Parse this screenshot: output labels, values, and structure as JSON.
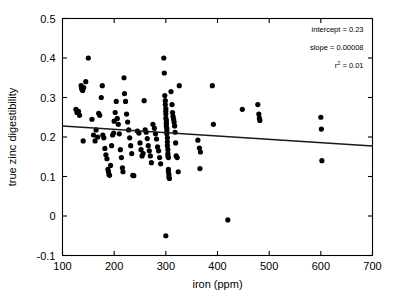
{
  "chart_data": {
    "type": "scatter",
    "title": "",
    "xlabel": "iron (ppm)",
    "ylabel": "true zinc digestibility",
    "xlim": [
      100,
      700
    ],
    "ylim": [
      -0.1,
      0.5
    ],
    "xticks": [
      100,
      200,
      300,
      400,
      500,
      600,
      700
    ],
    "xtick_labels": [
      "100",
      "200",
      "300",
      "400",
      "500",
      "600",
      "700"
    ],
    "yticks": [
      -0.1,
      0,
      0.1,
      0.2,
      0.3,
      0.4,
      0.5
    ],
    "ytick_labels": [
      "-0.1",
      "0",
      "0.1",
      "0.2",
      "0.3",
      "0.4",
      "0.5"
    ],
    "grid": false,
    "legend": false,
    "marker": "filled-circle",
    "marker_color": "#000000",
    "annotations": [
      "intercept = 0.23",
      "slope = 0.00008",
      "r² = 0.01"
    ],
    "annotation_intercept_label": "intercept = 0.23",
    "annotation_slope_label": "slope = 0.00008",
    "annotation_r2_prefix": "r",
    "annotation_r2_sup": "2",
    "annotation_r2_value": " = 0.01",
    "fit_line": {
      "intercept": 0.23,
      "slope": -8.5e-05,
      "x_start": 100,
      "y_start": 0.228,
      "x_end": 700,
      "y_end": 0.177,
      "color": "#1a1a1a"
    },
    "points": [
      [
        126,
        0.27
      ],
      [
        128,
        0.262
      ],
      [
        131,
        0.265
      ],
      [
        133,
        0.255
      ],
      [
        136,
        0.33
      ],
      [
        137,
        0.322
      ],
      [
        139,
        0.318
      ],
      [
        141,
        0.325
      ],
      [
        145,
        0.34
      ],
      [
        150,
        0.4
      ],
      [
        140,
        0.19
      ],
      [
        157,
        0.245
      ],
      [
        160,
        0.205
      ],
      [
        163,
        0.19
      ],
      [
        165,
        0.218
      ],
      [
        168,
        0.2
      ],
      [
        170,
        0.26
      ],
      [
        172,
        0.255
      ],
      [
        175,
        0.3
      ],
      [
        177,
        0.33
      ],
      [
        178,
        0.205
      ],
      [
        180,
        0.198
      ],
      [
        182,
        0.171
      ],
      [
        184,
        0.155
      ],
      [
        186,
        0.145
      ],
      [
        188,
        0.118
      ],
      [
        189,
        0.112
      ],
      [
        190,
        0.105
      ],
      [
        191,
        0.103
      ],
      [
        193,
        0.128
      ],
      [
        195,
        0.178
      ],
      [
        197,
        0.205
      ],
      [
        199,
        0.21
      ],
      [
        200,
        0.24
      ],
      [
        202,
        0.262
      ],
      [
        204,
        0.29
      ],
      [
        206,
        0.247
      ],
      [
        208,
        0.232
      ],
      [
        210,
        0.208
      ],
      [
        212,
        0.168
      ],
      [
        214,
        0.148
      ],
      [
        216,
        0.122
      ],
      [
        217,
        0.112
      ],
      [
        219,
        0.35
      ],
      [
        220,
        0.31
      ],
      [
        222,
        0.29
      ],
      [
        224,
        0.258
      ],
      [
        226,
        0.238
      ],
      [
        228,
        0.218
      ],
      [
        230,
        0.198
      ],
      [
        232,
        0.178
      ],
      [
        234,
        0.158
      ],
      [
        236,
        0.103
      ],
      [
        238,
        0.102
      ],
      [
        245,
        0.215
      ],
      [
        248,
        0.21
      ],
      [
        250,
        0.185
      ],
      [
        252,
        0.168
      ],
      [
        254,
        0.152
      ],
      [
        256,
        0.158
      ],
      [
        258,
        0.292
      ],
      [
        260,
        0.218
      ],
      [
        262,
        0.212
      ],
      [
        264,
        0.196
      ],
      [
        266,
        0.178
      ],
      [
        268,
        0.165
      ],
      [
        270,
        0.152
      ],
      [
        272,
        0.135
      ],
      [
        275,
        0.232
      ],
      [
        278,
        0.222
      ],
      [
        280,
        0.208
      ],
      [
        282,
        0.195
      ],
      [
        284,
        0.175
      ],
      [
        286,
        0.165
      ],
      [
        288,
        0.148
      ],
      [
        290,
        0.132
      ],
      [
        296,
        0.4
      ],
      [
        297,
        0.362
      ],
      [
        298,
        0.305
      ],
      [
        299,
        0.292
      ],
      [
        299,
        0.282
      ],
      [
        300,
        0.272
      ],
      [
        300,
        0.265
      ],
      [
        300,
        0.258
      ],
      [
        300,
        0.248
      ],
      [
        301,
        0.242
      ],
      [
        301,
        0.235
      ],
      [
        301,
        0.228
      ],
      [
        302,
        0.222
      ],
      [
        302,
        0.215
      ],
      [
        302,
        0.208
      ],
      [
        303,
        0.198
      ],
      [
        303,
        0.188
      ],
      [
        303,
        0.178
      ],
      [
        304,
        0.168
      ],
      [
        304,
        0.158
      ],
      [
        304,
        0.152
      ],
      [
        305,
        0.148
      ],
      [
        305,
        0.118
      ],
      [
        305,
        0.112
      ],
      [
        306,
        0.105
      ],
      [
        306,
        0.098
      ],
      [
        307,
        0.095
      ],
      [
        300,
        -0.05
      ],
      [
        310,
        0.315
      ],
      [
        312,
        0.282
      ],
      [
        313,
        0.262
      ],
      [
        314,
        0.252
      ],
      [
        315,
        0.245
      ],
      [
        316,
        0.238
      ],
      [
        317,
        0.228
      ],
      [
        318,
        0.212
      ],
      [
        319,
        0.185
      ],
      [
        320,
        0.152
      ],
      [
        322,
        0.148
      ],
      [
        324,
        0.112
      ],
      [
        326,
        0.33
      ],
      [
        362,
        0.192
      ],
      [
        365,
        0.172
      ],
      [
        367,
        0.162
      ],
      [
        366,
        0.12
      ],
      [
        390,
        0.33
      ],
      [
        392,
        0.232
      ],
      [
        420,
        -0.01
      ],
      [
        448,
        0.27
      ],
      [
        478,
        0.282
      ],
      [
        480,
        0.258
      ],
      [
        481,
        0.248
      ],
      [
        482,
        0.242
      ],
      [
        600,
        0.25
      ],
      [
        601,
        0.22
      ],
      [
        602,
        0.14
      ]
    ]
  }
}
